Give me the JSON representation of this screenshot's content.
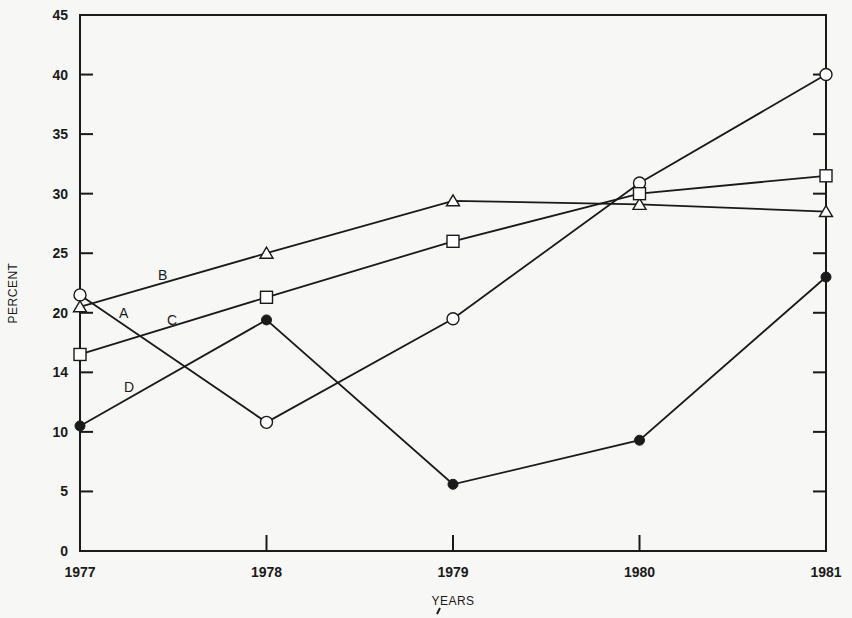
{
  "chart_data": {
    "type": "line",
    "title": "",
    "xlabel": "YEARS",
    "ylabel": "PERCENT",
    "x": [
      "1977",
      "1978",
      "1979",
      "1980",
      "1981"
    ],
    "y_tick_labels": [
      "0",
      "5",
      "10",
      "14",
      "20",
      "25",
      "30",
      "35",
      "40",
      "45"
    ],
    "y_tick_values": [
      0,
      5,
      10,
      15,
      20,
      25,
      30,
      35,
      40,
      45
    ],
    "ylim": [
      0,
      45
    ],
    "grid": false,
    "legend": "inline labels A, B, C, D near 1977",
    "series": [
      {
        "name": "A",
        "marker": "open-circle",
        "values": [
          21.5,
          10.8,
          19.5,
          30.9,
          40.0
        ]
      },
      {
        "name": "B",
        "marker": "open-triangle",
        "values": [
          20.5,
          25.0,
          29.4,
          29.1,
          28.5
        ]
      },
      {
        "name": "C",
        "marker": "open-square",
        "values": [
          16.5,
          21.3,
          26.0,
          30.0,
          31.5
        ]
      },
      {
        "name": "D",
        "marker": "filled-circle",
        "values": [
          10.5,
          19.4,
          5.6,
          9.3,
          23.0
        ]
      }
    ]
  },
  "axis": {
    "x_title": "YEARS",
    "y_title": "PERCENT"
  },
  "series_labels": {
    "A": "A",
    "B": "B",
    "C": "C",
    "D": "D"
  },
  "colors": {
    "ink": "#1a1a1a",
    "paper": "#f7f7f5"
  }
}
